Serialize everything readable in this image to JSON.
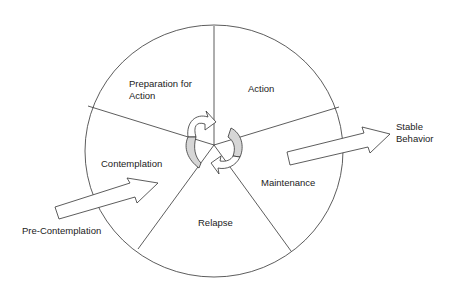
{
  "diagram": {
    "type": "cycle-wheel",
    "segments": [
      {
        "id": "preparation",
        "line1": "Preparation for",
        "line2": "Action"
      },
      {
        "id": "action",
        "label": "Action"
      },
      {
        "id": "maintenance",
        "label": "Maintenance"
      },
      {
        "id": "relapse",
        "label": "Relapse"
      },
      {
        "id": "contemplation",
        "label": "Contemplation"
      }
    ],
    "entry": {
      "label": "Pre-Contemplation"
    },
    "exit": {
      "line1": "Stable",
      "line2": "Behavior"
    },
    "colors": {
      "stroke": "#333333",
      "shade": "#d6d6d6",
      "background": "#ffffff"
    }
  }
}
